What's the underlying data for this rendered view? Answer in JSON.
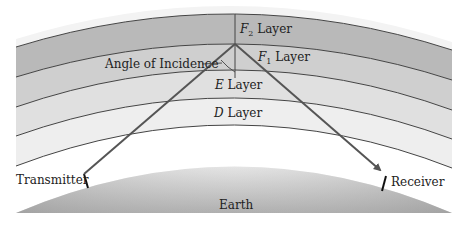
{
  "diagram": {
    "layers": [
      {
        "id": "f2",
        "letter": "F",
        "subscript": "2",
        "suffix": " Layer",
        "color": "#b9b9b9"
      },
      {
        "id": "f1",
        "letter": "F",
        "subscript": "1",
        "suffix": " Layer",
        "color": "#cfcfcf"
      },
      {
        "id": "e",
        "letter": "E",
        "subscript": "",
        "suffix": " Layer",
        "color": "#e0e0e0"
      },
      {
        "id": "d",
        "letter": "D",
        "subscript": "",
        "suffix": " Layer",
        "color": "#eeeeee"
      }
    ],
    "labels": {
      "angle": "Angle of Incidence",
      "transmitter": "Transmitter",
      "receiver": "Receiver",
      "earth": "Earth"
    },
    "colors": {
      "ray": "#555555",
      "boundary": "#444444",
      "earth_dark": "#9a9a9a",
      "earth_light": "#f2f2f2"
    }
  }
}
